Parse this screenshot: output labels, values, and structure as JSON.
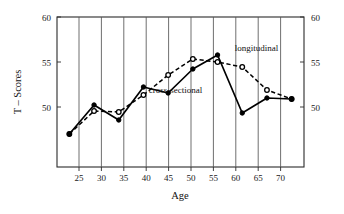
{
  "chart_data": {
    "type": "line",
    "title": "",
    "xlabel": "Age",
    "ylabel": "T – Scores",
    "x": [
      25,
      30,
      35,
      40,
      45,
      50,
      55,
      60,
      65,
      70
    ],
    "xticklabels": [
      "25",
      "30",
      "35",
      "40",
      "45",
      "50",
      "55",
      "60",
      "65",
      "70"
    ],
    "yticks": [
      50,
      55,
      60
    ],
    "yticklabels_left": [
      "50",
      "55",
      "60"
    ],
    "yticklabels_right": [
      "50",
      "55",
      "60"
    ],
    "ylim": [
      45.0,
      60.0
    ],
    "xlim": [
      22.5,
      72.5
    ],
    "grid": "vertical-only",
    "legend": "inline-annotations",
    "series": [
      {
        "name": "cross-sectional",
        "style": "solid",
        "marker": "filled-circle",
        "values": [
          48.3,
          51.2,
          49.7,
          53.0,
          52.4,
          54.8,
          56.2,
          50.4,
          51.9,
          51.8
        ]
      },
      {
        "name": "longitudinal",
        "style": "dashed",
        "marker": "open-circle",
        "values": [
          48.3,
          50.6,
          50.5,
          52.2,
          54.2,
          55.8,
          55.5,
          55.0,
          52.7,
          51.8
        ]
      }
    ],
    "annotations": [
      {
        "text": "longitudinal",
        "x": 58.5,
        "y": 56.6
      },
      {
        "text": "cross-sectional",
        "x": 46.5,
        "y": 52.4
      }
    ]
  },
  "axes": {
    "y_axis_title": "T – Scores",
    "x_axis_title": "Age"
  }
}
